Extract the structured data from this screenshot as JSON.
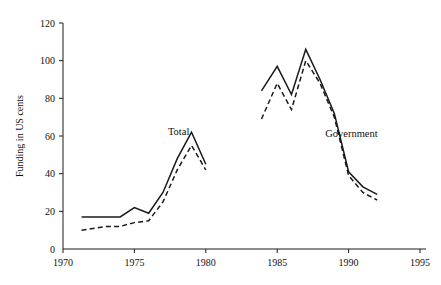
{
  "chart_data": {
    "type": "line",
    "title": "",
    "xlabel": "",
    "ylabel": "Funding in US cents",
    "xlim": [
      1970,
      1995
    ],
    "ylim": [
      0,
      120
    ],
    "grid": false,
    "legend_position": "inline-annotations",
    "xticks": [
      1970,
      1975,
      1980,
      1985,
      1990,
      1995
    ],
    "yticks": [
      0,
      20,
      40,
      60,
      80,
      100,
      120
    ],
    "xtick_labels": [
      "1970",
      "1975",
      "1980",
      "1985",
      "1990",
      "1995"
    ],
    "ytick_labels": [
      "0",
      "20",
      "40",
      "60",
      "80",
      "100",
      "120"
    ],
    "annotations": [
      {
        "text": "Total",
        "x": 1978.1,
        "y": 60.5
      },
      {
        "text": "Government",
        "x": 1990.2,
        "y": 59.5
      }
    ],
    "series": [
      {
        "name": "Total (solid)",
        "style": "solid",
        "x": [
          1971.3,
          1973.0,
          1974.0,
          1975.0,
          1976.0,
          1977.0,
          1978.0,
          1979.0,
          1980.0
        ],
        "values": [
          17,
          17,
          17,
          22,
          19,
          30,
          48,
          62,
          45
        ]
      },
      {
        "name": "Total (dashed)",
        "style": "dashed",
        "x": [
          1971.3,
          1973.0,
          1974.0,
          1975.0,
          1976.0,
          1977.0,
          1978.0,
          1979.0,
          1980.0
        ],
        "values": [
          10,
          12,
          12,
          14,
          15,
          25,
          42,
          55,
          42
        ]
      },
      {
        "name": "Government (solid)",
        "style": "solid",
        "x": [
          1983.9,
          1985.0,
          1986.0,
          1987.0,
          1988.0,
          1989.0,
          1990.0,
          1991.0,
          1992.0
        ],
        "values": [
          84,
          97,
          82,
          106,
          90,
          72,
          41,
          33,
          29
        ]
      },
      {
        "name": "Government (dashed)",
        "style": "dashed",
        "x": [
          1983.9,
          1985.0,
          1986.0,
          1987.0,
          1988.0,
          1989.0,
          1990.0,
          1991.0,
          1992.0
        ],
        "values": [
          69,
          88,
          74,
          100,
          88,
          70,
          39,
          30,
          26
        ]
      }
    ]
  }
}
